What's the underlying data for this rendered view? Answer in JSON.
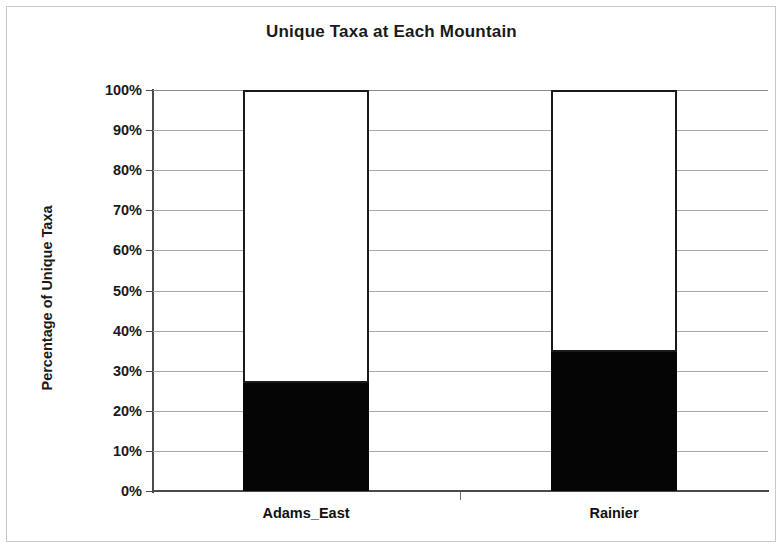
{
  "chart_data": {
    "type": "bar",
    "subtype": "stacked-100-percent",
    "title": "Unique Taxa at Each Mountain",
    "xlabel": "",
    "ylabel": "Percentage of Unique Taxa",
    "categories": [
      "Adams_East",
      "Rainier"
    ],
    "ylim": [
      0,
      100
    ],
    "ytick_labels": [
      "100%",
      "90%",
      "80%",
      "70%",
      "60%",
      "50%",
      "40%",
      "30%",
      "20%",
      "10%",
      "0%"
    ],
    "ytick_values": [
      100,
      90,
      80,
      70,
      60,
      50,
      40,
      30,
      20,
      10,
      0
    ],
    "grid": true,
    "legend": "none",
    "series": [
      {
        "name": "Unique Taxa",
        "color": "#050505",
        "values": [
          27,
          34.7
        ]
      },
      {
        "name": "Remainder",
        "color": "#ffffff",
        "values": [
          73,
          65.3
        ]
      }
    ]
  },
  "colors": {
    "unique_taxa": "#050505",
    "remainder": "#ffffff",
    "outline": "#1a1a1a",
    "gridline": "#a8a8a8",
    "axis": "#4a4a4a"
  }
}
